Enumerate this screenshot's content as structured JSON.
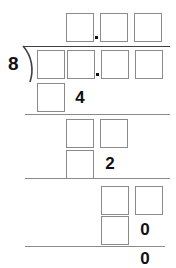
{
  "problem": {
    "type": "long-division-worksheet",
    "divisor": "8",
    "decimal_point": ".",
    "colors": {
      "box_border": "#8a8a8a",
      "digit": "#111111",
      "rule": "#8a8a8a",
      "bracket": "#3f3f3f",
      "background": "#ffffff"
    },
    "quotient_row": {
      "label": "quotient",
      "boxes": [
        "",
        "",
        ""
      ],
      "decimal_after_box": 1
    },
    "dividend_row": {
      "label": "dividend",
      "boxes": [
        "",
        "",
        "",
        ""
      ],
      "decimal_after_box": 2
    },
    "step_rows": [
      {
        "label": "subtract-1",
        "boxes": [
          ""
        ],
        "digits": [
          "4"
        ],
        "rule_after": true
      },
      {
        "label": "bring-down-1",
        "boxes": [
          "",
          ""
        ],
        "digits": [],
        "rule_after": false
      },
      {
        "label": "subtract-2",
        "boxes": [
          ""
        ],
        "digits": [
          "2"
        ],
        "rule_after": true
      },
      {
        "label": "bring-down-2",
        "boxes": [
          "",
          ""
        ],
        "digits": [],
        "rule_after": false
      },
      {
        "label": "subtract-3",
        "boxes": [
          ""
        ],
        "digits": [
          "0"
        ],
        "rule_after": true
      }
    ],
    "remainder": {
      "label": "remainder",
      "value": "0"
    }
  }
}
